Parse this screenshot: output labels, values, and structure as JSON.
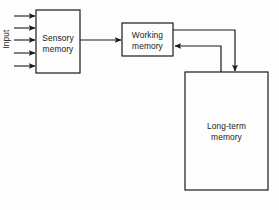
{
  "diagram": {
    "background_color": "#fdfdfd",
    "stroke_color": "#1a1a1a",
    "text_color": "#1a1a1a",
    "labels": {
      "input": "Input",
      "sensory_memory": "Sensory\nmemory",
      "working_memory": "Working\nmemory",
      "longterm_memory": "Long-term\nmemory"
    },
    "boxes": [
      {
        "name": "sensory-memory",
        "label": "Sensory\nmemory",
        "x": 36,
        "y": 10,
        "width": 44,
        "height": 63
      },
      {
        "name": "working-memory",
        "label": "Working\nmemory",
        "x": 122,
        "y": 23,
        "width": 51,
        "height": 33
      },
      {
        "name": "longterm-memory",
        "label": "Long-term\nmemory",
        "x": 185,
        "y": 72,
        "width": 83,
        "height": 118
      }
    ],
    "input_arrows": {
      "count": 5,
      "x_start": 14,
      "x_end": 36,
      "y_positions": [
        16,
        28,
        40,
        53,
        66
      ]
    },
    "connectors": [
      {
        "name": "sensory-to-working",
        "from": "sensory-memory",
        "to": "working-memory",
        "direction": "right"
      },
      {
        "name": "working-to-longterm",
        "from": "working-memory",
        "to": "longterm-memory",
        "direction": "down"
      },
      {
        "name": "longterm-to-working",
        "from": "longterm-memory",
        "to": "working-memory",
        "direction": "left"
      }
    ]
  }
}
